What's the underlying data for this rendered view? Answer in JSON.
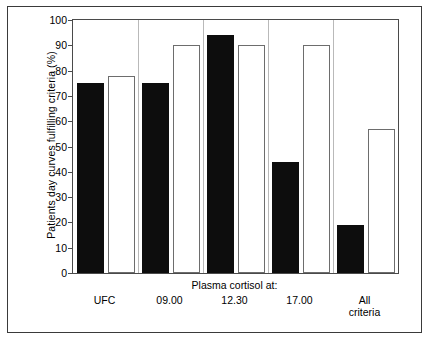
{
  "chart_data": {
    "type": "bar",
    "title": "",
    "xlabel": "Plasma cortisol at:",
    "ylabel": "Patients day curves fulfilling criteria (%)",
    "categories": [
      "UFC",
      "09.00",
      "12.30",
      "17.00",
      "All\ncriteria"
    ],
    "series": [
      {
        "name": "filled",
        "style": "solid-black",
        "values": [
          75,
          75,
          94,
          44,
          19
        ]
      },
      {
        "name": "open",
        "style": "open-white",
        "values": [
          78,
          90,
          90,
          90,
          57
        ]
      }
    ],
    "ylim": [
      0,
      100
    ],
    "ytick_labels": [
      "0",
      "10",
      "20",
      "30",
      "40",
      "50",
      "60",
      "70",
      "80",
      "90",
      "100"
    ],
    "ytick_values": [
      0,
      10,
      20,
      30,
      40,
      50,
      60,
      70,
      80,
      90,
      100
    ],
    "grid": false,
    "legend": "none",
    "group_caption_span": [
      "09.00",
      "12.30",
      "17.00"
    ],
    "colors": {
      "bar_filled": "#0d0d0d",
      "bar_open_fill": "#ffffff",
      "bar_open_edge": "#6d6d6d",
      "axis": "#4a4a4a",
      "figure_border": "#3a3a3a",
      "background": "#ffffff",
      "text": "#000000"
    }
  },
  "axis": {
    "y_title": "Patients day curves fulfilling criteria (%)",
    "x_caption": "Plasma cortisol at:"
  }
}
